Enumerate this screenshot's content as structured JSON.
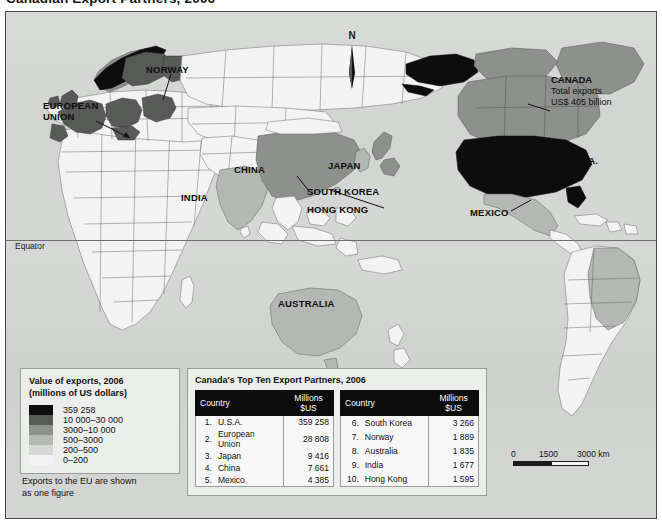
{
  "title": "Canadian Export Partners, 2006",
  "map": {
    "north_arrow_label": "N",
    "equator_label": "Equator",
    "labels": [
      {
        "id": "european-union",
        "text": "EUROPEAN\nUNION"
      },
      {
        "id": "norway",
        "text": "NORWAY"
      },
      {
        "id": "china",
        "text": "CHINA"
      },
      {
        "id": "india",
        "text": "INDIA"
      },
      {
        "id": "japan",
        "text": "JAPAN"
      },
      {
        "id": "south-korea",
        "text": "SOUTH KOREA"
      },
      {
        "id": "hong-kong",
        "text": "HONG KONG"
      },
      {
        "id": "australia",
        "text": "AUSTRALIA"
      },
      {
        "id": "usa",
        "text": "U.S.A."
      },
      {
        "id": "mexico",
        "text": "MEXICO"
      }
    ],
    "label_texts": {
      "european_union_l1": "EUROPEAN",
      "european_union_l2": "UNION",
      "norway": "NORWAY",
      "china": "CHINA",
      "india": "INDIA",
      "japan": "JAPAN",
      "south_korea": "SOUTH KOREA",
      "hong_kong": "HONG KONG",
      "australia": "AUSTRALIA",
      "usa": "U.S.A.",
      "mexico": "MEXICO"
    },
    "canada_annotation": {
      "heading": "CANADA",
      "line1": "Total exports",
      "line2": "US$ 405 billion"
    }
  },
  "legend": {
    "title_line1": "Value of exports, 2006",
    "title_line2": "(millions of US dollars)",
    "classes": [
      {
        "label": "359 258",
        "color": "#0d0d0d"
      },
      {
        "label": "10 000–30 000",
        "color": "#575a57"
      },
      {
        "label": "3000–10 000",
        "color": "#8d908d"
      },
      {
        "label": "500–3000",
        "color": "#b4b7b4"
      },
      {
        "label": "200–500",
        "color": "#d6d8d6"
      },
      {
        "label": "0–200",
        "color": "#f2f3f2"
      }
    ],
    "note_line1": "Exports to the EU are shown",
    "note_line2": "as one figure"
  },
  "table": {
    "title": "Canada's Top Ten Export Partners, 2006",
    "headers": {
      "country": "Country",
      "value": "Millions $US"
    },
    "left_rows": [
      {
        "rank": "1.",
        "country": "U.S.A.",
        "value": "359 258"
      },
      {
        "rank": "2.",
        "country": "European Union",
        "value": "28 808"
      },
      {
        "rank": "3.",
        "country": "Japan",
        "value": "9 416"
      },
      {
        "rank": "4.",
        "country": "China",
        "value": "7 661"
      },
      {
        "rank": "5.",
        "country": "Mexico",
        "value": "4 385"
      }
    ],
    "right_rows": [
      {
        "rank": "6.",
        "country": "South Korea",
        "value": "3 266"
      },
      {
        "rank": "7.",
        "country": "Norway",
        "value": "1 889"
      },
      {
        "rank": "8.",
        "country": "Australia",
        "value": "1 835"
      },
      {
        "rank": "9.",
        "country": "India",
        "value": "1 677"
      },
      {
        "rank": "10.",
        "country": "Hong Kong",
        "value": "1 595"
      }
    ]
  },
  "scale": {
    "tick_0": "0",
    "tick_1": "1500",
    "tick_2": "3000 km"
  },
  "colors": {
    "ocean": "#d4d6d4",
    "frame": "#4a4a4a",
    "class_max": "#0d0d0d",
    "panel_bg": "#eceeec"
  }
}
